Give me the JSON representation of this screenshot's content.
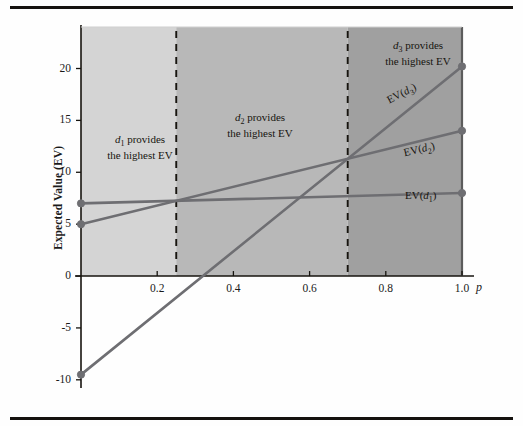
{
  "figure": {
    "background": "#fefefe",
    "rule_color": "#15120f"
  },
  "chart_data": {
    "type": "line",
    "title": "",
    "xlabel": "p",
    "ylabel": "Expected Value (EV)",
    "xlim": [
      0,
      1.0
    ],
    "ylim": [
      -10.5,
      24
    ],
    "grid": false,
    "legend_position": "inline-right",
    "x_ticks": [
      "0.2",
      "0.4",
      "0.6",
      "0.8",
      "1.0"
    ],
    "x_tick_values": [
      0.2,
      0.4,
      0.6,
      0.8,
      1.0
    ],
    "y_ticks": [
      "20",
      "15",
      "10",
      "5",
      "0",
      "-5",
      "-10"
    ],
    "y_tick_values": [
      20,
      15,
      10,
      5,
      0,
      -5,
      -10
    ],
    "series": [
      {
        "name": "EV(d1)",
        "label_html": "EV(<i>d</i><sub>1</sub>)",
        "color": "#6e6e72",
        "x": [
          0,
          1.0
        ],
        "values": [
          7,
          8
        ],
        "markers": [
          {
            "x": 0,
            "y": 7
          },
          {
            "x": 1.0,
            "y": 8
          }
        ]
      },
      {
        "name": "EV(d2)",
        "label_html": "EV(<i>d</i><sub>2</sub>)",
        "color": "#6e6e72",
        "x": [
          0,
          1.0
        ],
        "values": [
          5,
          14
        ],
        "markers": [
          {
            "x": 0,
            "y": 5
          },
          {
            "x": 1.0,
            "y": 14
          }
        ]
      },
      {
        "name": "EV(d3)",
        "label_html": "EV(<i>d</i><sub>3</sub>)",
        "color": "#6e6e72",
        "x": [
          0,
          1.0
        ],
        "values": [
          -9.5,
          20.2
        ],
        "markers": [
          {
            "x": 0,
            "y": -9.5
          },
          {
            "x": 1.0,
            "y": 20.2
          }
        ]
      }
    ],
    "regions": [
      {
        "id": "region-d1",
        "x_start": 0,
        "x_end": 0.25,
        "fill": "#d4d4d4",
        "note_line1_html": "<i>d</i><sub>1</sub> provides",
        "note_line2": "the highest EV"
      },
      {
        "id": "region-d2",
        "x_start": 0.25,
        "x_end": 0.7,
        "fill": "#b8b8b8",
        "note_line1_html": "<i>d</i><sub>2</sub> provides",
        "note_line2": "the highest EV"
      },
      {
        "id": "region-d3",
        "x_start": 0.7,
        "x_end": 1.0,
        "fill": "#a0a0a0",
        "note_line1_html": "<i>d</i><sub>3</sub> provides",
        "note_line2": "the highest EV"
      }
    ],
    "dividers": [
      {
        "x": 0.25,
        "style": "dashed"
      },
      {
        "x": 0.7,
        "style": "dashed"
      }
    ],
    "intersections": [
      {
        "between": [
          "EV(d1)",
          "EV(d2)"
        ],
        "x": 0.25,
        "y": 7.25
      },
      {
        "between": [
          "EV(d2)",
          "EV(d3)"
        ],
        "x": 0.7,
        "y": 11.3
      },
      {
        "between": [
          "EV(d1)",
          "EV(d3)"
        ],
        "x": 0.565,
        "y": 7.56
      }
    ],
    "annotations": {
      "y_axis_title": "Expected Value (EV)",
      "x_axis_title": "p"
    }
  }
}
